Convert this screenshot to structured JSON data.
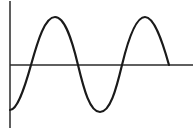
{
  "chart_data": {
    "type": "line",
    "title": "",
    "xlabel": "",
    "ylabel": "",
    "grid": false,
    "legend": null,
    "x": [
      0,
      0.25,
      0.5,
      0.75,
      1.0,
      1.25,
      1.5,
      1.75,
      2.0,
      2.25,
      2.5,
      2.75,
      3.0
    ],
    "series": [
      {
        "name": "wave",
        "values": [
          -1,
          -0.71,
          0,
          0.71,
          1,
          0.71,
          0,
          -0.71,
          -1,
          -0.71,
          0,
          0.71,
          1
        ]
      }
    ],
    "key_points": {
      "start_trough": [
        0,
        -1
      ],
      "first_zero": [
        0.5,
        0
      ],
      "first_peak": [
        1.0,
        1
      ],
      "second_zero": [
        1.5,
        0
      ],
      "trough": [
        2.0,
        -1
      ],
      "third_zero": [
        2.5,
        0
      ],
      "second_peak": [
        3.0,
        1
      ],
      "end_zero": [
        3.5,
        0
      ]
    },
    "ylim": [
      -1,
      1
    ],
    "colors": {
      "line": "#1a1a1a",
      "axis": "#2a2a2a",
      "background": "#ffffff"
    }
  },
  "pixel_path": {
    "d": "M 10 110 C 17 110, 24 90, 31 65 C 38 40, 45 17, 55 17 C 65 17, 72 40, 78 65 C 84 90, 90 112, 100 112 C 110 112, 116 90, 122 65 C 128 40, 136 17, 145 17 C 154 17, 162 40, 169 65"
  },
  "axes": {
    "y_axis": {
      "x": 10,
      "y1": 1,
      "y2": 128
    },
    "x_axis": {
      "y": 65,
      "x1": 10,
      "x2": 193
    }
  }
}
